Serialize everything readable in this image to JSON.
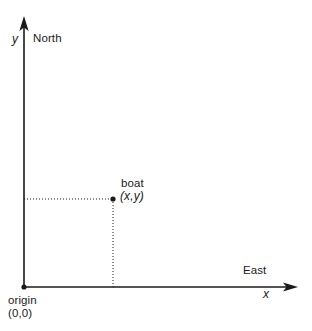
{
  "diagram": {
    "background_color": "#ffffff",
    "line_color": "#1a1a1a",
    "axes": {
      "y_axis": {
        "symbol": "y",
        "direction_label": "North",
        "origin_px": [
          24,
          287
        ],
        "tip_px": [
          24,
          17
        ]
      },
      "x_axis": {
        "symbol": "x",
        "direction_label": "East",
        "origin_px": [
          24,
          287
        ],
        "tip_px": [
          297,
          287
        ]
      }
    },
    "points": [
      {
        "name": "origin",
        "label": "origin",
        "coords_label": "(0,0)",
        "px": [
          24,
          287
        ]
      },
      {
        "name": "boat",
        "label": "boat",
        "coords_label": "(x,y)",
        "px": [
          113,
          199
        ]
      }
    ],
    "guides": [
      {
        "name": "horizontal-projection",
        "from_px": [
          24,
          199
        ],
        "to_px": [
          113,
          199
        ],
        "style": "dotted"
      },
      {
        "name": "vertical-projection",
        "from_px": [
          113,
          199
        ],
        "to_px": [
          113,
          287
        ],
        "style": "dotted"
      }
    ]
  }
}
